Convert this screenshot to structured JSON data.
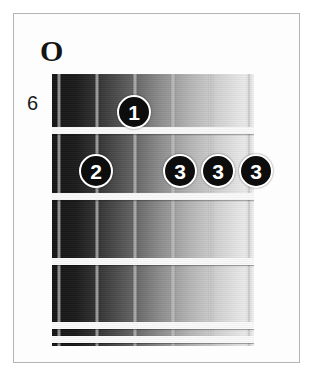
{
  "diagram": {
    "type": "guitar-chord-diagram",
    "open_string_marker": "O",
    "fret_position_label": "6",
    "string_count": 6,
    "fret_count": 5,
    "colors": {
      "frame_border": "#b4b4b4",
      "background": "#ffffff",
      "fret_line": "#fafafa",
      "string": "#bebebe",
      "marker_fill": "#0d0d0d",
      "marker_ring": "#ffffff",
      "marker_text": "#ffffff",
      "label_text": "#141414",
      "fretboard_dark": "#151515",
      "fretboard_light": "#efefef"
    },
    "strings": [
      {
        "index": 1,
        "x": 5
      },
      {
        "index": 2,
        "x": 43
      },
      {
        "index": 3,
        "x": 81
      },
      {
        "index": 4,
        "x": 119
      },
      {
        "index": 5,
        "x": 157
      },
      {
        "index": 6,
        "x": 195
      }
    ],
    "frets": [
      {
        "index": 1,
        "y": 53
      },
      {
        "index": 2,
        "y": 119
      },
      {
        "index": 3,
        "y": 184
      },
      {
        "index": 4,
        "y": 248
      },
      {
        "index": 5,
        "y": 262
      }
    ],
    "finger_markers": [
      {
        "label": "1",
        "string": 3,
        "fret": 1,
        "x": 134,
        "y": 112
      },
      {
        "label": "2",
        "string": 2,
        "fret": 2,
        "x": 96,
        "y": 171
      },
      {
        "label": "3",
        "string": 4,
        "fret": 2,
        "x": 180,
        "y": 171
      },
      {
        "label": "3",
        "string": 5,
        "fret": 2,
        "x": 218,
        "y": 171
      },
      {
        "label": "3",
        "string": 6,
        "fret": 2,
        "x": 256,
        "y": 171
      }
    ]
  }
}
